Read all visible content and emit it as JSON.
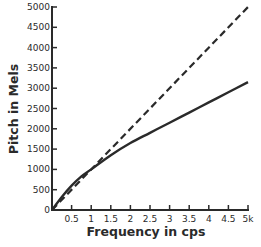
{
  "chart_data": {
    "type": "line",
    "title": "",
    "xlabel": "Frequency in cps",
    "ylabel": "Pitch in Mels",
    "xlim": [
      0,
      5000
    ],
    "ylim": [
      0,
      5000
    ],
    "grid": false,
    "legend": null,
    "x_ticks": [
      {
        "value": 500,
        "label": "0.5"
      },
      {
        "value": 1000,
        "label": "1"
      },
      {
        "value": 1500,
        "label": "1.5"
      },
      {
        "value": 2000,
        "label": "2"
      },
      {
        "value": 2500,
        "label": "2.5"
      },
      {
        "value": 3000,
        "label": "3"
      },
      {
        "value": 3500,
        "label": "3.5"
      },
      {
        "value": 4000,
        "label": "4"
      },
      {
        "value": 4500,
        "label": "4.5"
      },
      {
        "value": 5000,
        "label": "5k"
      }
    ],
    "y_ticks": [
      {
        "value": 0,
        "label": "0"
      },
      {
        "value": 500,
        "label": "500"
      },
      {
        "value": 1000,
        "label": "1000"
      },
      {
        "value": 1500,
        "label": "1500"
      },
      {
        "value": 2000,
        "label": "2000"
      },
      {
        "value": 2500,
        "label": "2500"
      },
      {
        "value": 3000,
        "label": "3000"
      },
      {
        "value": 3500,
        "label": "3500"
      },
      {
        "value": 4000,
        "label": "4000"
      },
      {
        "value": 4500,
        "label": "4500"
      },
      {
        "value": 5000,
        "label": "5000"
      }
    ],
    "series": [
      {
        "name": "Mel scale",
        "style": "solid",
        "x": [
          0,
          250,
          500,
          750,
          1000,
          1500,
          2000,
          2500,
          3000,
          3500,
          4000,
          4500,
          5000
        ],
        "y": [
          0,
          320,
          600,
          830,
          1000,
          1350,
          1650,
          1900,
          2150,
          2400,
          2650,
          2900,
          3150
        ]
      },
      {
        "name": "Linear reference",
        "style": "dashed",
        "x": [
          0,
          5000
        ],
        "y": [
          0,
          5000
        ]
      }
    ]
  }
}
